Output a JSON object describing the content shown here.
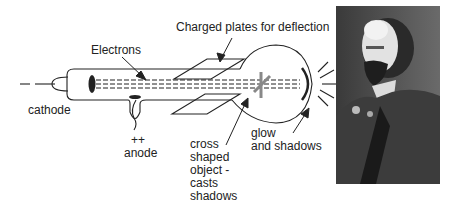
{
  "diagram": {
    "labels": {
      "charged_plates": "Charged plates for deflection",
      "electrons": "Electrons",
      "cathode": "cathode",
      "anode_sign": "++",
      "anode": "anode",
      "cross_line1": "cross",
      "cross_line2": "shaped",
      "cross_line3": "object -",
      "cross_line4": "casts",
      "cross_line5": "shadows",
      "glow_line1": "glow",
      "glow_line2": "and shadows"
    },
    "colors": {
      "line": "#222222",
      "cross": "#888888",
      "background": "#ffffff"
    }
  },
  "photo": {
    "description": "black-and-white portrait photograph of a bearded man in a suit"
  }
}
